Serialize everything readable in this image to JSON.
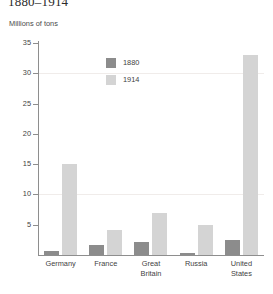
{
  "chart_data": {
    "type": "bar",
    "title": "1880–1914",
    "subtitle": "Millions of tons",
    "xlabel": "",
    "ylabel": "Millions of tons",
    "ylim": [
      0,
      35
    ],
    "yticks": [
      5,
      10,
      15,
      20,
      25,
      30,
      35
    ],
    "grid": "faint horizontal lines at 10 and 30",
    "legend_position": "top-center-inside",
    "categories": [
      "Germany",
      "France",
      "Great Britain",
      "Russia",
      "United States"
    ],
    "series": [
      {
        "name": "1880",
        "color": "#8c8c8c",
        "values": [
          0.7,
          1.7,
          2.1,
          0.4,
          2.5
        ]
      },
      {
        "name": "1914",
        "color": "#d4d4d4",
        "values": [
          15,
          4.2,
          7,
          5,
          33
        ]
      }
    ]
  },
  "axis": {
    "ticks": [
      {
        "label": "35",
        "value": 35
      },
      {
        "label": "30",
        "value": 30
      },
      {
        "label": "25",
        "value": 25
      },
      {
        "label": "20",
        "value": 20
      },
      {
        "label": "15",
        "value": 15
      },
      {
        "label": "10",
        "value": 10
      },
      {
        "label": "5",
        "value": 5
      }
    ]
  },
  "categories": [
    {
      "line1": "Germany",
      "line2": ""
    },
    {
      "line1": "France",
      "line2": ""
    },
    {
      "line1": "Great",
      "line2": "Britain"
    },
    {
      "line1": "Russia",
      "line2": ""
    },
    {
      "line1": "United",
      "line2": "States"
    }
  ],
  "legend": {
    "items": [
      {
        "label": "1880",
        "color": "#8c8c8c"
      },
      {
        "label": "1914",
        "color": "#d4d4d4"
      }
    ]
  }
}
